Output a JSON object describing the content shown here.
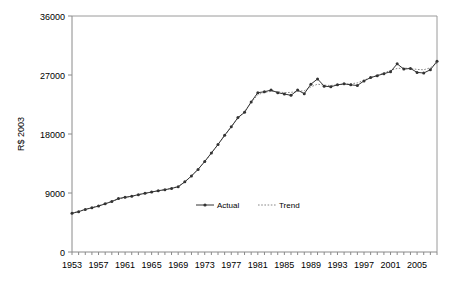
{
  "chart_data": {
    "type": "line",
    "title": "",
    "xlabel": "",
    "ylabel": "R$ 2003",
    "ylim": [
      0,
      36000
    ],
    "xlim": [
      1953,
      2008
    ],
    "yticks": [
      0,
      9000,
      18000,
      27000,
      36000
    ],
    "ytick_labels": [
      "0",
      "9000",
      "18000",
      "27000",
      "36000"
    ],
    "xtick_labels": [
      "1953",
      "1957",
      "1961",
      "1965",
      "1969",
      "1973",
      "1977",
      "1981",
      "1985",
      "1989",
      "1993",
      "1997",
      "2001",
      "2005"
    ],
    "xtick_values": [
      1953,
      1957,
      1961,
      1965,
      1969,
      1973,
      1977,
      1981,
      1985,
      1989,
      1993,
      1997,
      2001,
      2005
    ],
    "minor_tick_interval": 1,
    "grid": false,
    "legend_position": "inside-bottom-center",
    "x": [
      1953,
      1954,
      1955,
      1956,
      1957,
      1958,
      1959,
      1960,
      1961,
      1962,
      1963,
      1964,
      1965,
      1966,
      1967,
      1968,
      1969,
      1970,
      1971,
      1972,
      1973,
      1974,
      1975,
      1976,
      1977,
      1978,
      1979,
      1980,
      1981,
      1982,
      1983,
      1984,
      1985,
      1986,
      1987,
      1988,
      1989,
      1990,
      1991,
      1992,
      1993,
      1994,
      1995,
      1996,
      1997,
      1998,
      1999,
      2000,
      2001,
      2002,
      2003,
      2004,
      2005,
      2006,
      2007,
      2008
    ],
    "series": [
      {
        "name": "Actual",
        "color": "#333333",
        "style": "solid-with-markers",
        "values": [
          5900,
          6150,
          6500,
          6750,
          7000,
          7350,
          7700,
          8150,
          8350,
          8500,
          8750,
          8950,
          9150,
          9350,
          9500,
          9700,
          9950,
          10700,
          11600,
          12600,
          13800,
          15100,
          16400,
          17800,
          19100,
          20500,
          21300,
          22900,
          24300,
          24450,
          24700,
          24300,
          24100,
          23900,
          24700,
          24150,
          25600,
          26400,
          25300,
          25200,
          25500,
          25650,
          25500,
          25400,
          26100,
          26600,
          26900,
          27200,
          27500,
          28700,
          27900,
          28000,
          27400,
          27300,
          27800,
          29100
        ]
      },
      {
        "name": "Trend",
        "color": "#888888",
        "style": "dotted",
        "values": [
          5950,
          6200,
          6480,
          6760,
          7050,
          7380,
          7720,
          8050,
          8300,
          8520,
          8740,
          8950,
          9150,
          9340,
          9520,
          9720,
          10000,
          10700,
          11600,
          12650,
          13800,
          15050,
          16400,
          17750,
          19100,
          20400,
          21450,
          22800,
          24000,
          24350,
          24500,
          24450,
          24300,
          24350,
          24500,
          24600,
          25200,
          25600,
          25450,
          25400,
          25500,
          25600,
          25650,
          25800,
          26200,
          26600,
          26950,
          27300,
          27700,
          28000,
          28050,
          28000,
          27850,
          27800,
          28100,
          28800
        ]
      }
    ]
  },
  "legend": {
    "items": [
      {
        "label": "Actual",
        "marker": "line-with-dot-marker"
      },
      {
        "label": "Trend",
        "marker": "dotted-line"
      }
    ]
  }
}
